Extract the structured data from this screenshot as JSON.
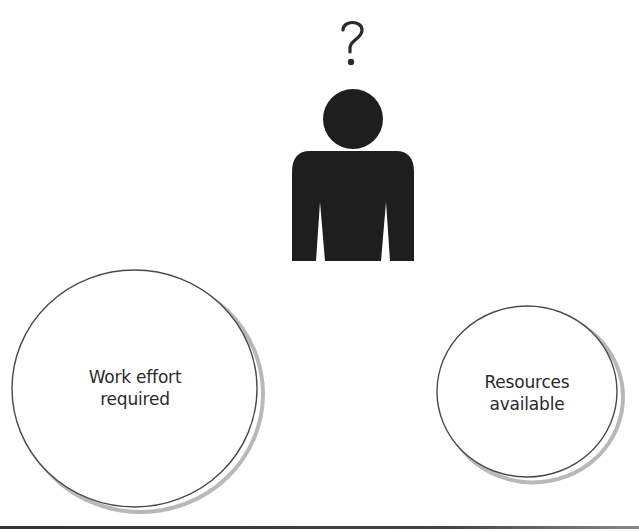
{
  "figure": {
    "person": {
      "thought_symbol": "?",
      "fill_color": "#1e1e1e"
    },
    "circles": [
      {
        "id": "work-effort",
        "line1": "Work effort",
        "line2": "required"
      },
      {
        "id": "resources",
        "line1": "Resources",
        "line2": "available"
      }
    ],
    "colors": {
      "outline": "#4a4a4a",
      "shadow": "#b8b8b8",
      "background": "#ffffff"
    }
  }
}
